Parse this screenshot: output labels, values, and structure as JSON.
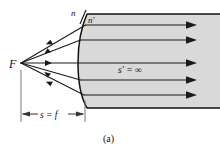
{
  "figure": {
    "caption": "(a)",
    "labels": {
      "focal_point": "F",
      "index_left": "n",
      "index_right": "n′",
      "image_distance": "s′ = ∞",
      "object_distance": "s = f"
    },
    "colors": {
      "background": "#ffffff",
      "medium_fill": "#d9d9d9",
      "medium_stroke": "#111111",
      "ray_stroke": "#1a1a1a",
      "dimension_stroke": "#555555",
      "text": "#111111"
    },
    "geometry": {
      "focal_point": {
        "x": 21,
        "y": 63
      },
      "vertex": {
        "x": 85,
        "y": 63
      },
      "medium_top_y": 14,
      "medium_bottom_y": 108,
      "medium_right_x": 220,
      "ray_exit_ys": [
        25,
        40,
        63,
        80,
        95
      ],
      "dimension_line_y": 114
    },
    "ray_count": 5
  }
}
